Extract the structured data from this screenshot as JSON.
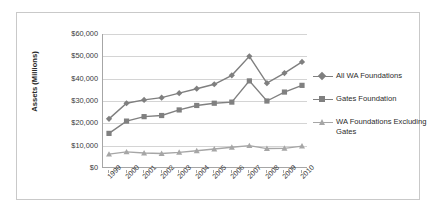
{
  "chart_data": {
    "type": "line",
    "title": "",
    "xlabel": "",
    "ylabel": "Assets (Millions)",
    "categories": [
      "1999",
      "2000",
      "2001",
      "2002",
      "2003",
      "2004",
      "2005",
      "2006",
      "2007",
      "2008",
      "2009",
      "2010"
    ],
    "ylim": [
      0,
      60000
    ],
    "ytick_values": [
      0,
      10000,
      20000,
      30000,
      40000,
      50000,
      60000
    ],
    "ytick_labels": [
      "$0",
      "$10,000",
      "$20,000",
      "$30,000",
      "$40,000",
      "$50,000",
      "$60,000"
    ],
    "grid": true,
    "legend_position": "right",
    "series": [
      {
        "name": "All WA Foundations",
        "marker": "diamond",
        "color": "#7f7f7f",
        "values": [
          22000,
          29000,
          30500,
          31500,
          33500,
          35500,
          37500,
          41500,
          50000,
          38000,
          42500,
          47500
        ]
      },
      {
        "name": "Gates Foundation",
        "marker": "square",
        "color": "#808080",
        "values": [
          15500,
          21000,
          23000,
          23500,
          26000,
          28000,
          29000,
          29500,
          39000,
          30000,
          34000,
          37000
        ]
      },
      {
        "name": "WA Foundations Excluding Gates",
        "marker": "triangle",
        "color": "#a6a6a6",
        "values": [
          6200,
          7200,
          6700,
          6500,
          7000,
          7700,
          8500,
          9300,
          10000,
          8700,
          8800,
          9800
        ]
      }
    ]
  },
  "legend": {
    "items": [
      {
        "label": "All WA Foundations"
      },
      {
        "label": "Gates Foundation"
      },
      {
        "label": "WA Foundations Excluding Gates"
      }
    ]
  }
}
